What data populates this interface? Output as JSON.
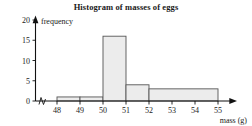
{
  "chart_data": {
    "type": "bar",
    "title": "Histogram of masses of eggs",
    "xlabel": "mass (g)",
    "ylabel": "frequency",
    "xlim": [
      47.35,
      55.9
    ],
    "ylim": [
      0,
      20
    ],
    "grid": false,
    "legend": false,
    "x_ticks": [
      "48",
      "49",
      "50",
      "51",
      "52",
      "53",
      "54",
      "55"
    ],
    "x_tick_values": [
      48,
      49,
      50,
      51,
      52,
      53,
      54,
      55
    ],
    "y_ticks": [
      "0",
      "5",
      "10",
      "15",
      "20"
    ],
    "y_tick_values": [
      0,
      5,
      10,
      15,
      20
    ],
    "bins": [
      {
        "label": "48-49",
        "start": 48,
        "end": 49,
        "frequency": 1
      },
      {
        "label": "49-50",
        "start": 49,
        "end": 50,
        "frequency": 1
      },
      {
        "label": "50-51",
        "start": 50,
        "end": 51,
        "frequency": 16
      },
      {
        "label": "51-52",
        "start": 51,
        "end": 52,
        "frequency": 4
      },
      {
        "label": "52-55",
        "start": 52,
        "end": 55,
        "frequency": 3
      }
    ],
    "categories": [
      "48-49",
      "49-50",
      "50-51",
      "51-52",
      "52-55"
    ],
    "values": [
      1,
      1,
      16,
      4,
      3
    ],
    "axis_break": true,
    "axis_break_note": "zigzag break on x-axis between origin and first bin",
    "colors": {
      "bar_fill": "#ececec",
      "bar_stroke": "#555555",
      "axis": "#111111",
      "text": "#1a1a1a",
      "background": "#ffffff"
    }
  }
}
